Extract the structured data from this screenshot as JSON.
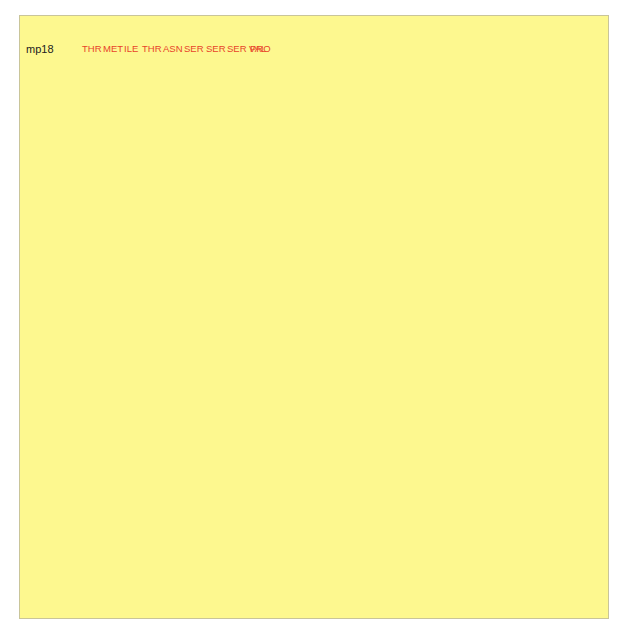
{
  "mp18": {
    "label": "mp18",
    "amino_acids": [
      "THR",
      "MET",
      "ILE",
      "THR",
      "ASN",
      "SER",
      "SER",
      "SER",
      "VAL",
      "PRO",
      "GLY",
      "ASP",
      "PRO",
      "LEU",
      "GLU",
      "SER",
      "THR",
      "CYS",
      "ARG",
      "HIS",
      "ALA",
      "SER",
      "LEU",
      "ALA",
      "LEU",
      "ALA"
    ],
    "codons": [
      "ATG",
      "ACC",
      "ATG",
      "ATT",
      "ACG",
      "AAT",
      "TCG",
      "AGC",
      "TCG",
      "GTA",
      "CCC",
      "GGG",
      "GAT",
      "CCT",
      "CTA",
      "GAG",
      "TCG",
      "ACC",
      "TGC",
      "AGG",
      "CAT",
      "GCA",
      "AGC",
      "TTG",
      "GCA",
      "CTG",
      "GCC"
    ],
    "sites": [
      "EcoRI",
      "SstI",
      "KpnI",
      "SmaI",
      "BamHI",
      "XbaI",
      "SalI",
      "PstI",
      "SphI",
      "HindIII"
    ]
  },
  "mp19": {
    "label": "mp19",
    "amino_acids": [
      "THR",
      "MET",
      "ILE",
      "THR",
      "PRO",
      "SER",
      "LEU",
      "HIS",
      "ALA",
      "CYS",
      "ARG",
      "SER",
      "THR",
      "LEU",
      "GLU",
      "ASP",
      "PRO",
      "ARG",
      "VAL",
      "PRO",
      "SER",
      "SER",
      "ASN",
      "SER",
      "LEU",
      "ALA"
    ],
    "codons": [
      "ATG",
      "ACC",
      "ATG",
      "ATT",
      "ACG",
      "CCA",
      "AGC",
      "TTG",
      "CAT",
      "GCC",
      "TGC",
      "AGG",
      "TCG",
      "ACT",
      "CTA",
      "GAG",
      "GAT",
      "CCC",
      "CGG",
      "GTA",
      "CCG",
      "AGC",
      "TCG",
      "AAT",
      "TCA",
      "CTG",
      "GCC"
    ],
    "sites": [
      "HindIII",
      "SphI",
      "PstI",
      "SalI",
      "XbaI",
      "BamHI",
      "SmaI",
      "KpnI",
      "SstI",
      "EcoRI"
    ]
  },
  "map": {
    "name": "M13 mp 18/19",
    "size": "7253 bp",
    "mcs_label": "MCS",
    "mcs_callout": "Multiple cloning site",
    "features": {
      "lacI": "lacI",
      "lacZ": "lacZ'",
      "ori": "Ori"
    },
    "sites": {
      "nar_top": "NarI",
      "nar_left": "NarI",
      "pvu": "PvuI",
      "bgl1": "BglI",
      "bgl2": "Bg/II",
      "sna": "SnaBI"
    }
  },
  "colors": {
    "background": "#fdf88f",
    "amino_acid": "#e8432a",
    "nucleotide": "#6fb6a8",
    "ring_fill": "#f6c9ae",
    "ring_stroke": "#b88c6a"
  }
}
